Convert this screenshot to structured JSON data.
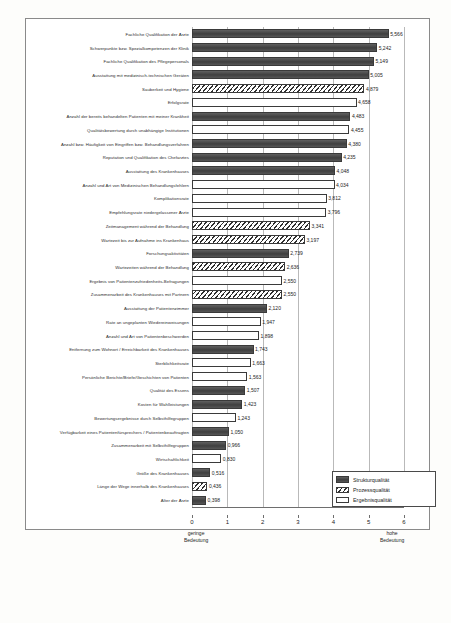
{
  "chart_data": {
    "type": "bar",
    "orientation": "horizontal",
    "title": "",
    "xlabel": "",
    "ylabel": "",
    "xlim": [
      0,
      6
    ],
    "xticks": [
      0,
      1,
      2,
      3,
      4,
      5,
      6
    ],
    "xtick_labels": [
      "0",
      "1",
      "2",
      "3",
      "4",
      "5",
      "6"
    ],
    "grid": true,
    "axis_note_left": "geringe\nBedeutung",
    "axis_note_left_line1": "geringe",
    "axis_note_left_line2": "Bedeutung",
    "axis_note_right_line1": "hohe",
    "axis_note_right_line2": "Bedeutung",
    "legend_position": "bottom-right",
    "legend": [
      {
        "key": "struktur",
        "label": "Strukturqualität"
      },
      {
        "key": "prozess",
        "label": "Prozessqualität"
      },
      {
        "key": "ergebnis",
        "label": "Ergebnisqualität"
      }
    ],
    "categories": [
      "Fachliche Qualifikation der Ärzte",
      "Schwerpunkte bzw. Spezialkompetenzen der Klinik",
      "Fachliche Qualifikation des Pflegepersonals",
      "Ausstattung mit medizinisch-technischen Geräten",
      "Sauberkeit und Hygiene",
      "Erfolgsrate",
      "Anzahl der bereits behandelten Patienten mit meiner Krankheit",
      "Qualitätsbewertung durch unabhängige Institutionen",
      "Anzahl bzw. Häufigkeit von Eingriffen bzw. Behandlungsverfahren",
      "Reputation und Qualifikation des Chefarztes",
      "Ausstattung des Krankenhauses",
      "Anzahl und Art von Medizinischen Behandlungsfehlern",
      "Komplikationsrate",
      "Empfehlungsrate niedergelassener Ärzte",
      "Zeitmanagement während der Behandlung",
      "Wartezeit bis zur Aufnahme ins Krankenhaus",
      "Forschungsaktivitäten",
      "Wartezeiten während der Behandlung",
      "Ergebnis von Patientenzufriedenheits-Befragungen",
      "Zusammenarbeit des Krankenhauses mit Partnern",
      "Ausstattung der Patientenzimmer",
      "Rate an ungeplanten Wiedereinweisungen",
      "Anzahl und Art von Patientenbeschwerden",
      "Entfernung zum Wohnort / Erreichbarkeit des Krankenhauses",
      "Sterblichkeitsrate",
      "Persönliche Berichte/Briefe/Geschichten von Patienten",
      "Qualität des Essens",
      "Kosten für Wahlleistungen",
      "Bewertungsergebnisse durch Selbsthilfegruppen",
      "Verfügbarkeit eines Patientenfürsprechers / Patientenbeauftragten",
      "Zusammenarbeit mit Selbsthilfegruppen",
      "Wirtschaftlichkeit",
      "Größe des Krankenhauses",
      "Länge der Wege innerhalb des Krankenhauses",
      "Alter der Ärzte"
    ],
    "values": [
      5.566,
      5.242,
      5.149,
      5.005,
      4.879,
      4.658,
      4.483,
      4.455,
      4.38,
      4.235,
      4.048,
      4.034,
      3.812,
      3.796,
      3.341,
      3.197,
      2.739,
      2.636,
      2.55,
      2.55,
      2.12,
      1.947,
      1.898,
      1.743,
      1.663,
      1.563,
      1.507,
      1.423,
      1.243,
      1.05,
      0.966,
      0.83,
      0.516,
      0.436,
      0.398
    ],
    "value_labels": [
      "5,566",
      "5,242",
      "5,149",
      "5,005",
      "4,879",
      "4,658",
      "4,483",
      "4,455",
      "4,380",
      "4,235",
      "4,048",
      "4,034",
      "3,812",
      "3,796",
      "3,341",
      "3,197",
      "2,739",
      "2,636",
      "2,550",
      "2,550",
      "2,120",
      "1,947",
      "1,898",
      "1,743",
      "1,663",
      "1,563",
      "1,507",
      "1,423",
      "1,243",
      "1,050",
      "0,966",
      "0,830",
      "0,516",
      "0,436",
      "0,398"
    ],
    "series_keys": [
      "struktur",
      "struktur",
      "struktur",
      "struktur",
      "prozess",
      "ergebnis",
      "struktur",
      "ergebnis",
      "struktur",
      "struktur",
      "struktur",
      "ergebnis",
      "ergebnis",
      "ergebnis",
      "prozess",
      "prozess",
      "struktur",
      "prozess",
      "ergebnis",
      "prozess",
      "struktur",
      "ergebnis",
      "ergebnis",
      "struktur",
      "ergebnis",
      "ergebnis",
      "struktur",
      "struktur",
      "ergebnis",
      "struktur",
      "struktur",
      "ergebnis",
      "struktur",
      "prozess",
      "struktur"
    ],
    "colors": {
      "struktur": "#4a4a4a",
      "prozess": "#2f2f2f",
      "ergebnis": "#ffffff",
      "border": "#3a3a3a",
      "grid": "#b9b9b9"
    }
  },
  "caption": ""
}
